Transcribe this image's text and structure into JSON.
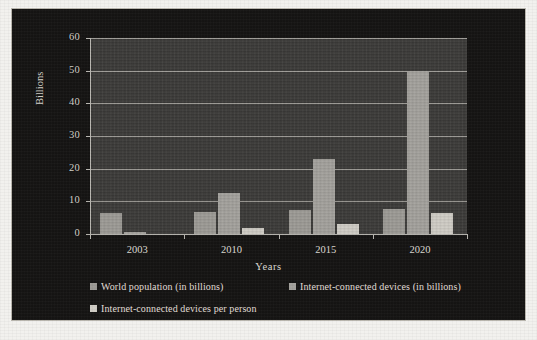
{
  "chart_data": {
    "type": "bar",
    "title": "",
    "subtitle": "",
    "xlabel": "Years",
    "ylabel": "Billions",
    "categories": [
      "2003",
      "2010",
      "2015",
      "2020"
    ],
    "series": [
      {
        "name": "World population (in billions)",
        "color": "#9c9a95",
        "values": [
          6.3,
          6.8,
          7.2,
          7.6
        ]
      },
      {
        "name": "Internet-connected devices (in billions)",
        "color": "#a3a19c",
        "values": [
          0.5,
          12.5,
          22.9,
          50
        ]
      },
      {
        "name": "Internet-connected devices per person",
        "color": "#cfccc5",
        "values": [
          0.08,
          1.84,
          3.0,
          6.58
        ]
      }
    ],
    "ylim": [
      0,
      60
    ],
    "ytick_values": [
      0,
      10,
      20,
      30,
      40,
      50,
      60
    ],
    "ytick_labels": [
      "0",
      "10",
      "20",
      "30",
      "40",
      "50",
      "60"
    ],
    "grid": "horizontal",
    "legend_position": "bottom",
    "background_color": "#151413",
    "plot_background_color": "#3b3a38",
    "grid_color": "#9d9b96",
    "text_color": "#dedbd4"
  },
  "axes": {
    "y_title": "Billions",
    "x_title": "Years",
    "y_ticks": [
      "60",
      "50",
      "40",
      "30",
      "20",
      "10",
      "0"
    ],
    "x_ticks": [
      "2003",
      "2010",
      "2015",
      "2020"
    ]
  },
  "legend": {
    "items": [
      {
        "label": "World population (in billions)",
        "swatch": "#9c9a95"
      },
      {
        "label": "Internet-connected devices (in billions)",
        "swatch": "#a3a19c"
      },
      {
        "label": "Internet-connected devices per person",
        "swatch": "#cfccc5"
      }
    ]
  }
}
